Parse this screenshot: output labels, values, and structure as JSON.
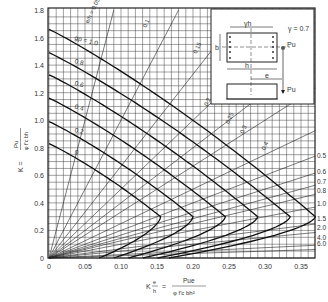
{
  "chart_data": {
    "type": "line",
    "title": "",
    "xlabel_prefix": "K",
    "xlabel_frac_top": "e",
    "xlabel_frac_bottom": "h",
    "xlabel_eq": "=",
    "xlabel_rhs_top": "Pue",
    "xlabel_rhs_bottom": "φ f'c bh²",
    "ylabel_prefix": "K =",
    "ylabel_rhs_top": "Pu",
    "ylabel_rhs_bottom": "φ f'c bh",
    "xlim": [
      0,
      0.37
    ],
    "ylim": [
      0,
      1.8
    ],
    "x_ticks": [
      "0",
      "0.05",
      "0.10",
      "0.15",
      "0.20",
      "0.25",
      "0.30",
      "0.35"
    ],
    "x_tick_values": [
      0,
      0.05,
      0.1,
      0.15,
      0.2,
      0.25,
      0.3,
      0.35
    ],
    "y_ticks": [
      "0",
      "0.2",
      "0.4",
      "0.6",
      "0.8",
      "1.0",
      "1.2",
      "1.4",
      "1.6",
      "1.8"
    ],
    "y_tick_values": [
      0,
      0.2,
      0.4,
      0.6,
      0.8,
      1.0,
      1.2,
      1.4,
      1.6,
      1.8
    ],
    "grid": true,
    "gamma": "γ = 0.7",
    "series_label_prefix": "gρ =",
    "series": [
      {
        "name": "gρ = 1.0",
        "label": "gρ = 1.0",
        "y0": 1.66,
        "nose_x": 0.37
      },
      {
        "name": "0.8",
        "label": "0.8",
        "y0": 1.49,
        "nose_x": 0.335
      },
      {
        "name": "0.6",
        "label": "0.6",
        "y0": 1.33,
        "nose_x": 0.29
      },
      {
        "name": "0.4",
        "label": "0.4",
        "y0": 1.16,
        "nose_x": 0.245
      },
      {
        "name": "0.2",
        "label": "0.2",
        "y0": 0.99,
        "nose_x": 0.2
      },
      {
        "name": "0",
        "label": "0",
        "y0": 0.83,
        "nose_x": 0.155
      }
    ],
    "eccentricity_lines": {
      "label_prefix": "e/h =",
      "inner_labels": [
        "0.05",
        "0.1",
        "0.15",
        "0.2",
        "0.25",
        "0.3",
        "0.4"
      ],
      "values": [
        0.05,
        0.1,
        0.15,
        0.2,
        0.25,
        0.3,
        0.4,
        0.5,
        0.6,
        0.7,
        0.8,
        1.0,
        1.5,
        2.0,
        4.0,
        6.0
      ],
      "right_labels": [
        "0.5",
        "0.6",
        "0.7",
        "0.8",
        "1.0",
        "1.5",
        "2.0",
        "4.0",
        "6.0"
      ]
    },
    "inset": {
      "yh_label": "γh",
      "b_label": "b",
      "h_label": "h",
      "e_label": "e",
      "pu_label": "Pu",
      "pu_label2": "Pu",
      "gamma_label": "γ = 0.7"
    }
  }
}
